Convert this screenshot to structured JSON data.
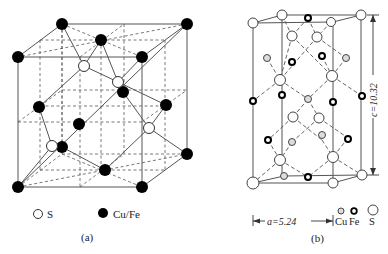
{
  "figure_a": {
    "caption": "(a)",
    "legend": [
      {
        "symbol": "open-circle",
        "label": "S"
      },
      {
        "symbol": "filled-circle",
        "label": "Cu/Fe"
      }
    ]
  },
  "figure_b": {
    "caption": "(b)",
    "lattice_a_label": "a=5.24",
    "lattice_c_label": "c=10.32",
    "legend": [
      {
        "symbol": "small-grey-circle",
        "label": "Cu"
      },
      {
        "symbol": "small-bold-circle",
        "label": "Fe"
      },
      {
        "symbol": "large-open-circle",
        "label": "S"
      }
    ]
  },
  "colors": {
    "line": "#555555",
    "metal": "#000000",
    "sulfur_fill": "#ffffff"
  }
}
